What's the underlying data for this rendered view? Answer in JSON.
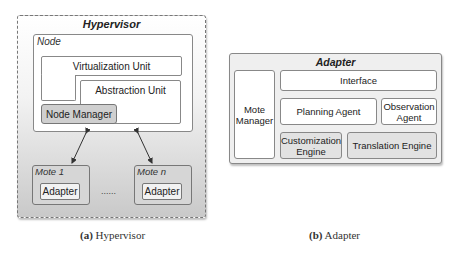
{
  "hypervisor_panel": {
    "title": "Hypervisor",
    "node": {
      "label": "Node",
      "virtualization_unit": "Virtualization Unit",
      "abstraction_unit": "Abstraction Unit",
      "node_manager": "Node Manager"
    },
    "motes": [
      {
        "label": "Mote 1",
        "adapter": "Adapter"
      },
      {
        "label": "Mote n",
        "adapter": "Adapter"
      }
    ],
    "ellipsis": "......",
    "caption_prefix": "(a)",
    "caption_text": "Hypervisor"
  },
  "adapter_panel": {
    "title": "Adapter",
    "mote_manager": "Mote Manager",
    "interface": "Interface",
    "planning_agent": "Planning  Agent",
    "observation_agent": "Observation Agent",
    "customization_engine": "Customization Engine",
    "translation_engine": "Translation Engine",
    "caption_prefix": "(b)",
    "caption_text": "Adapter"
  }
}
